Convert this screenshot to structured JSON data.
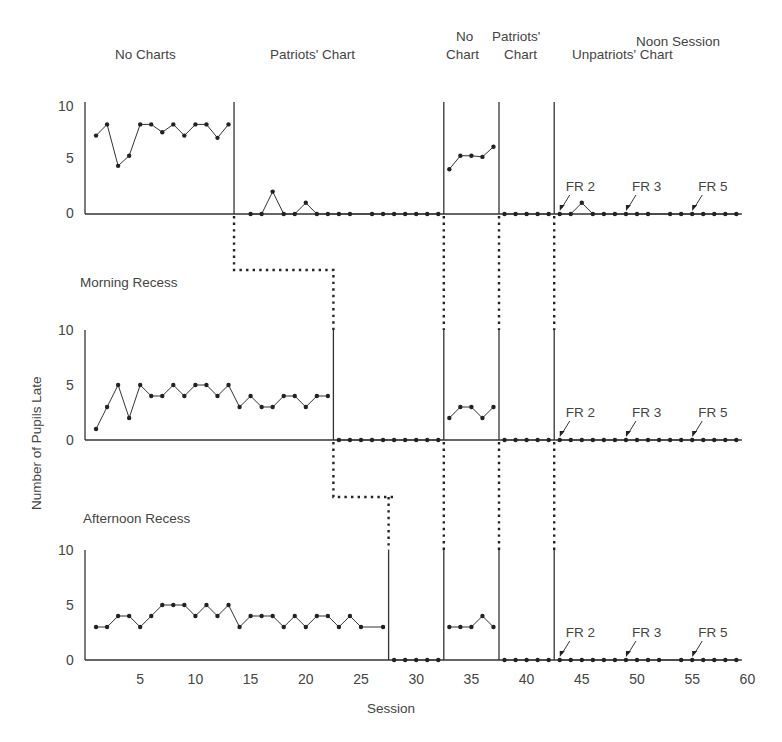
{
  "chart_data": {
    "type": "line",
    "title": "",
    "xlabel": "Session",
    "ylabel": "Number of Pupils Late",
    "xlim": [
      0,
      60
    ],
    "x_ticks": [
      5,
      10,
      15,
      20,
      25,
      30,
      35,
      40,
      45,
      50,
      55,
      60
    ],
    "ylim": [
      0,
      10
    ],
    "y_ticks": [
      0,
      5,
      10
    ],
    "grid": false,
    "panels": [
      {
        "name": "Noon Session",
        "phase_labels": [
          {
            "text": "No Charts",
            "x": 7
          },
          {
            "text": "Patriots' Chart",
            "x": 23
          },
          {
            "text": "No\nChart",
            "x": 35
          },
          {
            "text": "Patriots'\nChart",
            "x": 40
          },
          {
            "text": "Unpatriots' Chart",
            "x": 51
          }
        ],
        "phase_changes": [
          13.5,
          32.5,
          37.5,
          42.5
        ],
        "series": [
          {
            "x": [
              1,
              2,
              3,
              4,
              5,
              6,
              7,
              8,
              9,
              10,
              11,
              12,
              13
            ],
            "y": [
              7,
              8,
              4.3,
              5.2,
              8,
              8,
              7.3,
              8,
              7,
              8,
              8,
              6.8,
              8
            ]
          },
          {
            "x": [
              15,
              16,
              17,
              18,
              19,
              20,
              21,
              22,
              23,
              24,
              26,
              27,
              28,
              29,
              30,
              31,
              32
            ],
            "y": [
              0,
              0,
              2,
              0,
              0,
              1,
              0,
              0,
              0,
              0,
              0,
              0,
              0,
              0,
              0,
              0,
              0
            ]
          },
          {
            "x": [
              33,
              34,
              35,
              36,
              37
            ],
            "y": [
              4,
              5.2,
              5.2,
              5.1,
              6
            ]
          },
          {
            "x": [
              38,
              39,
              40,
              41,
              42
            ],
            "y": [
              0,
              0,
              0,
              0,
              0
            ]
          },
          {
            "x": [
              43,
              44,
              45,
              46,
              47,
              48,
              49,
              50,
              51,
              53,
              54,
              55,
              56,
              57,
              58,
              59
            ],
            "y": [
              0,
              0,
              1,
              0,
              0,
              0,
              0,
              0,
              0,
              0,
              0,
              0,
              0,
              0,
              0,
              0
            ]
          }
        ],
        "annotations": [
          {
            "text": "FR 2",
            "x": 43
          },
          {
            "text": "FR 3",
            "x": 49
          },
          {
            "text": "FR 5",
            "x": 55
          }
        ]
      },
      {
        "name": "Morning Recess",
        "phase_changes": [
          22.5,
          32.5,
          37.5,
          42.5
        ],
        "series": [
          {
            "x": [
              1,
              2,
              3,
              4,
              5,
              6,
              7,
              8,
              9,
              10,
              11,
              12,
              13,
              14,
              15,
              16,
              17,
              18,
              19,
              20,
              21,
              22
            ],
            "y": [
              1,
              3,
              5,
              2,
              5,
              4,
              4,
              5,
              4,
              5,
              5,
              4,
              5,
              3,
              4,
              3,
              3,
              4,
              4,
              3,
              4,
              4
            ]
          },
          {
            "x": [
              23,
              24,
              25,
              26,
              27,
              28,
              29,
              30,
              31,
              32
            ],
            "y": [
              0,
              0,
              0,
              0,
              0,
              0,
              0,
              0,
              0,
              0
            ]
          },
          {
            "x": [
              33,
              34,
              35,
              36,
              37
            ],
            "y": [
              2,
              3,
              3,
              2,
              3
            ]
          },
          {
            "x": [
              38,
              39,
              40,
              41,
              42
            ],
            "y": [
              0,
              0,
              0,
              0,
              0
            ]
          },
          {
            "x": [
              43,
              44,
              45,
              46,
              47,
              48,
              49,
              50,
              51,
              52,
              53,
              54,
              55,
              56,
              57,
              58,
              59
            ],
            "y": [
              0,
              0,
              0,
              0,
              0,
              0,
              0,
              0,
              0,
              0,
              0,
              0,
              0,
              0,
              0,
              0,
              0
            ]
          }
        ],
        "annotations": [
          {
            "text": "FR 2",
            "x": 43
          },
          {
            "text": "FR 3",
            "x": 49
          },
          {
            "text": "FR 5",
            "x": 55
          }
        ]
      },
      {
        "name": "Afternoon Recess",
        "phase_changes": [
          27.5,
          32.5,
          37.5,
          42.5
        ],
        "series": [
          {
            "x": [
              1,
              2,
              3,
              4,
              5,
              6,
              7,
              8,
              9,
              10,
              11,
              12,
              13,
              14,
              15,
              16,
              17,
              18,
              19,
              20,
              21,
              22,
              23,
              24,
              25,
              27
            ],
            "y": [
              3,
              3,
              4,
              4,
              3,
              4,
              5,
              5,
              5,
              4,
              5,
              4,
              5,
              3,
              4,
              4,
              4,
              3,
              4,
              3,
              4,
              4,
              3,
              4,
              3,
              3
            ]
          },
          {
            "x": [
              28,
              29,
              30,
              31,
              32
            ],
            "y": [
              0,
              0,
              0,
              0,
              0
            ]
          },
          {
            "x": [
              33,
              34,
              35,
              36,
              37
            ],
            "y": [
              3,
              3,
              3,
              4,
              3
            ]
          },
          {
            "x": [
              38,
              39,
              40,
              41,
              42
            ],
            "y": [
              0,
              0,
              0,
              0,
              0
            ]
          },
          {
            "x": [
              43,
              44,
              45,
              46,
              47,
              48,
              49,
              50,
              51,
              52,
              54,
              55,
              56,
              57,
              58,
              59
            ],
            "y": [
              0,
              0,
              0,
              0,
              0,
              0,
              0,
              0,
              0,
              0,
              0,
              0,
              0,
              0,
              0,
              0
            ]
          }
        ],
        "annotations": [
          {
            "text": "FR 2",
            "x": 43
          },
          {
            "text": "FR 3",
            "x": 49
          },
          {
            "text": "FR 5",
            "x": 55
          }
        ]
      }
    ]
  },
  "labels": {
    "noon_session": "Noon Session",
    "phase_no_charts": "No Charts",
    "phase_patriots_chart": "Patriots' Chart",
    "phase_no": "No",
    "phase_chart": "Chart",
    "phase_patriots": "Patriots'",
    "phase_chart2": "Chart",
    "phase_unpatriots_chart": "Unpatriots' Chart",
    "morning_recess": "Morning Recess",
    "afternoon_recess": "Afternoon Recess",
    "ylabel": "Number of Pupils Late",
    "xlabel": "Session",
    "fr2": "FR 2",
    "fr3": "FR 3",
    "fr5": "FR 5",
    "y10": "10",
    "y5": "5",
    "y0": "0"
  }
}
